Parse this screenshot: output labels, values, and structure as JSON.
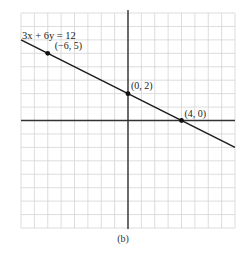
{
  "chart_data": {
    "type": "line",
    "title": "",
    "equation_label": "3x + 6y = 12",
    "xlabel": "",
    "ylabel": "",
    "xlim": [
      -8,
      8
    ],
    "ylim": [
      -8,
      8
    ],
    "grid": true,
    "grid_step": 1,
    "axes": true,
    "series": [
      {
        "name": "3x + 6y = 12",
        "x": [
          -8,
          8
        ],
        "y": [
          6,
          -2
        ]
      }
    ],
    "points": [
      {
        "x": -6,
        "y": 5,
        "label": "(−6, 5)"
      },
      {
        "x": 0,
        "y": 2,
        "label": "(0, 2)"
      },
      {
        "x": 4,
        "y": 0,
        "label": "(4, 0)"
      }
    ],
    "caption": "(b)"
  },
  "colors": {
    "grid": "#d4d4d4",
    "axis": "#333333",
    "line": "#1a1a1a",
    "point": "#111111"
  }
}
